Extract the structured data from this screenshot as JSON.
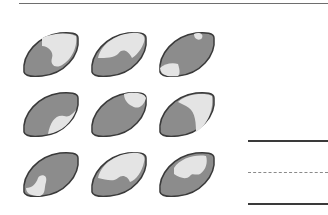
{
  "worksheet": {
    "fruit_count": 9,
    "grid": {
      "rows": 3,
      "cols": 3
    },
    "fruits": [
      {
        "row": 1,
        "col": 1,
        "icon": "lemon-half-shaded-icon"
      },
      {
        "row": 1,
        "col": 2,
        "icon": "lemon-half-shaded-icon"
      },
      {
        "row": 1,
        "col": 3,
        "icon": "lemon-mostly-shaded-icon"
      },
      {
        "row": 2,
        "col": 1,
        "icon": "lemon-mostly-shaded-icon"
      },
      {
        "row": 2,
        "col": 2,
        "icon": "lemon-mostly-shaded-icon"
      },
      {
        "row": 2,
        "col": 3,
        "icon": "lemon-half-shaded-icon"
      },
      {
        "row": 3,
        "col": 1,
        "icon": "lemon-mostly-shaded-icon"
      },
      {
        "row": 3,
        "col": 2,
        "icon": "lemon-half-shaded-icon"
      },
      {
        "row": 3,
        "col": 3,
        "icon": "lemon-mostly-shaded-icon"
      }
    ],
    "answer_lines": [
      "solid",
      "dashed",
      "solid"
    ],
    "colors": {
      "dark_fill": "#8c8c8c",
      "light_fill": "#e4e4e4",
      "outline": "#3a3a3a"
    }
  }
}
